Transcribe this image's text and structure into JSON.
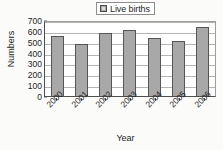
{
  "chart_data": {
    "type": "bar",
    "title": "",
    "subtitle": "",
    "xlabel": "Year",
    "ylabel": "Numbers",
    "categories": [
      "2000",
      "2001",
      "2002",
      "2003",
      "2004",
      "2005",
      "2006"
    ],
    "series": [
      {
        "name": "Live births",
        "values": [
          550,
          475,
          580,
          610,
          530,
          510,
          640
        ]
      }
    ],
    "ylim": [
      0,
      700
    ],
    "y_ticks": [
      0,
      100,
      200,
      300,
      400,
      500,
      600,
      700
    ],
    "y_tick_labels": [
      "0",
      "100",
      "200",
      "300",
      "400",
      "500",
      "600",
      "700"
    ],
    "grid": true,
    "grid_axis": "y",
    "legend_position": "top-right",
    "legend_entries": [
      "Live births"
    ],
    "bar_color": "#a8a8a8",
    "bar_border_color": "#555555",
    "axis_color": "#4f4f4f",
    "grid_color": "#b4b4b4",
    "plot_background": "#ffffff",
    "figure_background": "#fbfbfa"
  },
  "legend": {
    "label": "Live births",
    "swatch_name": "legend-swatch-live-births"
  },
  "axes": {
    "y_title": "Numbers",
    "x_title": "Year"
  }
}
